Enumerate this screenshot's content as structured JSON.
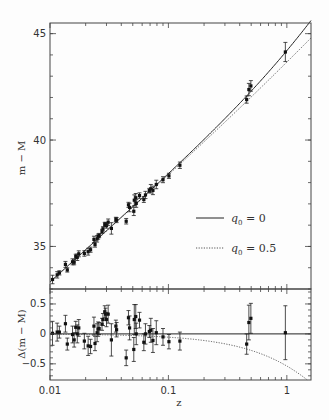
{
  "chart_data": [
    {
      "type": "scatter",
      "panel": "top",
      "title": "",
      "xlabel": "z",
      "ylabel": "m − M",
      "xscale": "log",
      "xlim": [
        0.01,
        1.6
      ],
      "ylim": [
        33.0,
        45.5
      ],
      "yticks": [
        35,
        40,
        45
      ],
      "ytick_labels": [
        "35",
        "40",
        "45"
      ],
      "xticks": [
        0.01,
        0.1,
        1
      ],
      "xtick_labels": [
        "0.01",
        "0.1",
        "1"
      ],
      "grid": false,
      "legend_position": "lower right",
      "legend": [
        {
          "label_var": "q",
          "label_sub": "0",
          "label_value": "= 0",
          "style": "solid"
        },
        {
          "label_var": "q",
          "label_sub": "0",
          "label_value": "= 0.5",
          "style": "dotted"
        }
      ],
      "series": [
        {
          "name": "q0 = 0",
          "style": "solid",
          "kind": "model"
        },
        {
          "name": "q0 = 0.5",
          "style": "dotted",
          "kind": "model"
        },
        {
          "name": "Supernovae",
          "style": "points-with-errorbars",
          "kind": "data"
        }
      ]
    },
    {
      "type": "scatter",
      "panel": "bottom",
      "xlabel": "z",
      "ylabel": "Δ(m − M)",
      "xscale": "log",
      "xlim": [
        0.01,
        1.6
      ],
      "ylim": [
        -0.77,
        0.75
      ],
      "yticks": [
        -0.5,
        0,
        0.5
      ],
      "ytick_labels": [
        "−0.5",
        "0",
        "0.5"
      ],
      "xticks": [
        0.01,
        0.1,
        1
      ],
      "xtick_labels": [
        "0.01",
        "0.1",
        "1"
      ],
      "reference_line": 0,
      "points": [
        {
          "z": 0.0105,
          "d": 0.01,
          "e": 0.2
        },
        {
          "z": 0.0115,
          "d": 0.03,
          "e": 0.15
        },
        {
          "z": 0.012,
          "d": 0.03,
          "e": 0.1
        },
        {
          "z": 0.0135,
          "d": 0.17,
          "e": 0.14
        },
        {
          "z": 0.014,
          "d": -0.17,
          "e": 0.1
        },
        {
          "z": 0.0155,
          "d": -0.01,
          "e": 0.14
        },
        {
          "z": 0.016,
          "d": -0.1,
          "e": 0.12
        },
        {
          "z": 0.0165,
          "d": 0.11,
          "e": 0.1
        },
        {
          "z": 0.017,
          "d": 0.0,
          "e": 0.15
        },
        {
          "z": 0.0175,
          "d": 0.1,
          "e": 0.14
        },
        {
          "z": 0.0195,
          "d": -0.12,
          "e": 0.13
        },
        {
          "z": 0.021,
          "d": -0.2,
          "e": 0.16
        },
        {
          "z": 0.022,
          "d": -0.21,
          "e": 0.12
        },
        {
          "z": 0.0235,
          "d": 0.13,
          "e": 0.15
        },
        {
          "z": 0.024,
          "d": -0.16,
          "e": 0.12
        },
        {
          "z": 0.025,
          "d": 0.02,
          "e": 0.15
        },
        {
          "z": 0.0255,
          "d": 0.08,
          "e": 0.12
        },
        {
          "z": 0.026,
          "d": 0.09,
          "e": 0.1
        },
        {
          "z": 0.0275,
          "d": 0.16,
          "e": 0.1
        },
        {
          "z": 0.028,
          "d": 0.24,
          "e": 0.1
        },
        {
          "z": 0.029,
          "d": 0.37,
          "e": 0.1
        },
        {
          "z": 0.0295,
          "d": 0.33,
          "e": 0.1
        },
        {
          "z": 0.03,
          "d": 0.24,
          "e": 0.12
        },
        {
          "z": 0.031,
          "d": 0.33,
          "e": 0.15
        },
        {
          "z": 0.033,
          "d": -0.1,
          "e": 0.27
        },
        {
          "z": 0.036,
          "d": 0.13,
          "e": 0.1
        },
        {
          "z": 0.0365,
          "d": 0.07,
          "e": 0.12
        },
        {
          "z": 0.044,
          "d": -0.4,
          "e": 0.13
        },
        {
          "z": 0.046,
          "d": 0.27,
          "e": 0.12
        },
        {
          "z": 0.047,
          "d": 0.1,
          "e": 0.2
        },
        {
          "z": 0.051,
          "d": -0.26,
          "e": 0.2
        },
        {
          "z": 0.0515,
          "d": 0.24,
          "e": 0.25
        },
        {
          "z": 0.053,
          "d": 0.29,
          "e": 0.2
        },
        {
          "z": 0.0535,
          "d": 0.0,
          "e": 0.18
        },
        {
          "z": 0.057,
          "d": 0.23,
          "e": 0.13
        },
        {
          "z": 0.062,
          "d": -0.14,
          "e": 0.14
        },
        {
          "z": 0.064,
          "d": 0.0,
          "e": 0.17
        },
        {
          "z": 0.069,
          "d": 0.04,
          "e": 0.1
        },
        {
          "z": 0.071,
          "d": 0.06,
          "e": 0.2
        },
        {
          "z": 0.074,
          "d": -0.11,
          "e": 0.2
        },
        {
          "z": 0.079,
          "d": 0.02,
          "e": 0.2
        },
        {
          "z": 0.09,
          "d": -0.05,
          "e": 0.14
        },
        {
          "z": 0.101,
          "d": -0.13,
          "e": 0.12
        },
        {
          "z": 0.125,
          "d": -0.12,
          "e": 0.15
        },
        {
          "z": 0.458,
          "d": -0.17,
          "e": 0.17
        },
        {
          "z": 0.478,
          "d": 0.19,
          "e": 0.29
        },
        {
          "z": 0.497,
          "d": 0.26,
          "e": 0.25
        },
        {
          "z": 0.972,
          "d": 0.02,
          "e": 0.45
        }
      ]
    }
  ],
  "axes": {
    "top_ylabel": "m − M",
    "bottom_ylabel": "Δ(m − M)",
    "xlabel": "z"
  }
}
